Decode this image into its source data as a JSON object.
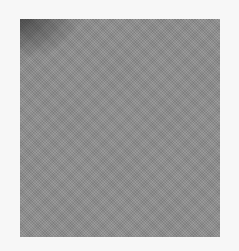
{
  "image": {
    "description": "Gray textured square on a white background",
    "background_color": "#f7f7f7",
    "swatch": {
      "fill_color": "#8e8e8e",
      "corner_shade_color": "#3a3a3a",
      "corner_shade_position": "top-left"
    }
  }
}
